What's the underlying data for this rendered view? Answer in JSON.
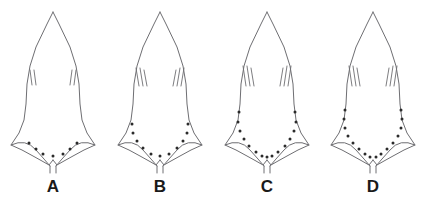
{
  "figure": {
    "type": "scientific-line-drawing-plate",
    "background_color": "#ffffff",
    "outline_color": "#6e6e72",
    "dot_color": "#2b2b2b",
    "label_color": "#1a1a1a",
    "panel_count": 4
  },
  "specimens": [
    {
      "id": "A",
      "label": "A",
      "dots_per_side": 3,
      "dots_total": 7,
      "lateral_ticks_per_side": 2,
      "arc_extent": "short"
    },
    {
      "id": "B",
      "label": "B",
      "dots_per_side": 5,
      "dots_total": 11,
      "lateral_ticks_per_side": 3,
      "arc_extent": "medium"
    },
    {
      "id": "C",
      "label": "C",
      "dots_per_side": 7,
      "dots_total": 15,
      "lateral_ticks_per_side": 3,
      "arc_extent": "long"
    },
    {
      "id": "D",
      "label": "D",
      "dots_per_side": 8,
      "dots_total": 17,
      "lateral_ticks_per_side": 3,
      "arc_extent": "longest"
    }
  ]
}
